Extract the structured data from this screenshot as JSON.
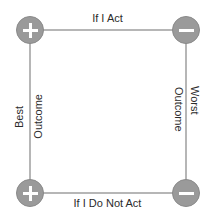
{
  "diagram": {
    "type": "2x2-decision-matrix",
    "background_color": "#ffffff",
    "line_color": "#b6b6b6",
    "node_fill_color": "#9a9a9a",
    "node_glyph_color": "#ffffff",
    "text_color": "#2b2b2b",
    "edges": {
      "top_label": "If I Act",
      "bottom_label": "If I Do Not Act",
      "left_label_part1": "Best",
      "left_label_part2": "Outcome",
      "right_label_part1": "Outcome",
      "right_label_part2": "Worst"
    },
    "nodes": [
      {
        "id": "top-left",
        "sign": "plus",
        "glyph": "plus-icon",
        "symbol": "+"
      },
      {
        "id": "top-right",
        "sign": "minus",
        "glyph": "minus-icon",
        "symbol": "−"
      },
      {
        "id": "bottom-left",
        "sign": "plus",
        "glyph": "plus-icon",
        "symbol": "+"
      },
      {
        "id": "bottom-right",
        "sign": "minus",
        "glyph": "minus-icon",
        "symbol": "−"
      }
    ]
  }
}
